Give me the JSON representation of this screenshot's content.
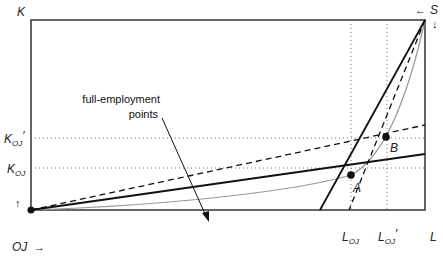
{
  "diagram": {
    "axis_labels": {
      "vertical": "K",
      "horizontal": "L",
      "origin_oj": "OJ",
      "origin_s": "S"
    },
    "tick_labels": {
      "k_oj": {
        "main": "K",
        "sub": "OJ",
        "prime": ""
      },
      "k_oj_prime": {
        "main": "K",
        "sub": "OJ",
        "prime": "′"
      },
      "l_oj": {
        "main": "L",
        "sub": "OJ",
        "prime": ""
      },
      "l_oj_prime": {
        "main": "L",
        "sub": "OJ",
        "prime": "′"
      }
    },
    "points": {
      "a": "A",
      "b": "B"
    },
    "annotation": {
      "line1": "full-employment",
      "line2": "points"
    },
    "arrows": {
      "up": "↑",
      "right": "→",
      "left": "←",
      "down": "↓"
    },
    "colors": {
      "frame": "#333333",
      "solid_line": "#111111",
      "contract_curve": "#999999",
      "dotted": "#777777"
    }
  }
}
